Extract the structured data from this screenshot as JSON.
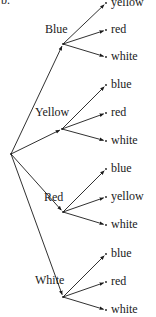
{
  "part_label": "b.",
  "root": {
    "x": 11,
    "y": 154
  },
  "colors": {
    "ink": "#1a1a1a",
    "background": "#ffffff"
  },
  "branches": [
    {
      "label": "Blue",
      "node": {
        "x": 63,
        "y": 44
      },
      "label_pos": {
        "x": 45,
        "y": 23
      },
      "leaves": [
        {
          "label": "yellow",
          "x": 106,
          "y": 3
        },
        {
          "label": "red",
          "x": 106,
          "y": 30
        },
        {
          "label": "white",
          "x": 106,
          "y": 57
        }
      ]
    },
    {
      "label": "Yellow",
      "node": {
        "x": 62,
        "y": 129
      },
      "label_pos": {
        "x": 35,
        "y": 106
      },
      "leaves": [
        {
          "label": "blue",
          "x": 106,
          "y": 85
        },
        {
          "label": "red",
          "x": 106,
          "y": 113
        },
        {
          "label": "white",
          "x": 106,
          "y": 141
        }
      ]
    },
    {
      "label": "Red",
      "node": {
        "x": 63,
        "y": 212
      },
      "label_pos": {
        "x": 44,
        "y": 191
      },
      "leaves": [
        {
          "label": "blue",
          "x": 106,
          "y": 169
        },
        {
          "label": "yellow",
          "x": 106,
          "y": 197
        },
        {
          "label": "white",
          "x": 106,
          "y": 225
        }
      ]
    },
    {
      "label": "White",
      "node": {
        "x": 63,
        "y": 297
      },
      "label_pos": {
        "x": 35,
        "y": 274
      },
      "leaves": [
        {
          "label": "blue",
          "x": 106,
          "y": 254
        },
        {
          "label": "red",
          "x": 106,
          "y": 282
        },
        {
          "label": "white",
          "x": 106,
          "y": 310
        }
      ]
    }
  ]
}
